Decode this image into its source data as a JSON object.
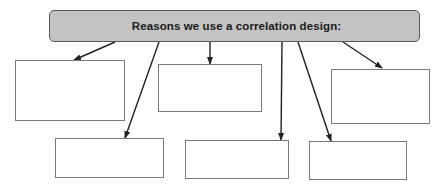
{
  "diagram": {
    "title": "Reasons we use a correlation design:",
    "colors": {
      "header_fill": "#c3c3c3",
      "header_border": "#5a5a5a",
      "box_border": "#7a7a7a",
      "arrow": "#222222"
    },
    "boxes": [
      {
        "id": "box-1",
        "label": "",
        "x": 15,
        "y": 60,
        "w": 110,
        "h": 61
      },
      {
        "id": "box-2",
        "label": "",
        "x": 158,
        "y": 64,
        "w": 104,
        "h": 48
      },
      {
        "id": "box-3",
        "label": "",
        "x": 331,
        "y": 69,
        "w": 99,
        "h": 55
      },
      {
        "id": "box-4",
        "label": "",
        "x": 55,
        "y": 138,
        "w": 109,
        "h": 40
      },
      {
        "id": "box-5",
        "label": "",
        "x": 185,
        "y": 140,
        "w": 104,
        "h": 39
      },
      {
        "id": "box-6",
        "label": "",
        "x": 309,
        "y": 141,
        "w": 98,
        "h": 39
      }
    ],
    "arrows": [
      {
        "from": [
          115,
          42
        ],
        "to": [
          74,
          60
        ],
        "target": "box-1"
      },
      {
        "from": [
          159,
          42
        ],
        "to": [
          125,
          138
        ],
        "target": "box-4"
      },
      {
        "from": [
          210,
          42
        ],
        "to": [
          210,
          64
        ],
        "target": "box-2"
      },
      {
        "from": [
          282,
          42
        ],
        "to": [
          281,
          140
        ],
        "target": "box-5"
      },
      {
        "from": [
          298,
          42
        ],
        "to": [
          331,
          141
        ],
        "target": "box-6"
      },
      {
        "from": [
          343,
          42
        ],
        "to": [
          382,
          68
        ],
        "target": "box-3"
      }
    ]
  }
}
